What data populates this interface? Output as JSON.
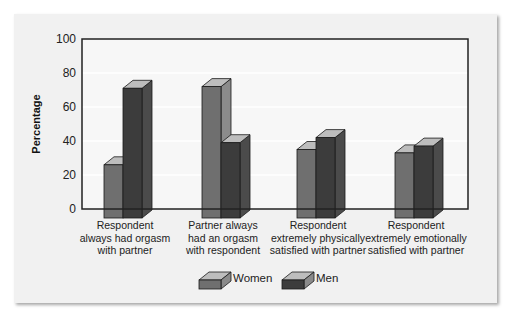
{
  "chart_data": {
    "type": "bar",
    "title": "",
    "xlabel": "",
    "ylabel": "Percentage",
    "ylim": [
      0,
      100
    ],
    "yticks": [
      0,
      20,
      40,
      60,
      80,
      100
    ],
    "grid": true,
    "legend_position": "bottom",
    "categories": [
      [
        "Respondent",
        "always had orgasm",
        "with partner"
      ],
      [
        "Partner always",
        "had an orgasm",
        "with respondent"
      ],
      [
        "Respondent",
        "extremely physically",
        "satisfied with partner"
      ],
      [
        "Respondent",
        "extremely emotionally",
        "satisfied with partner"
      ]
    ],
    "series": [
      {
        "name": "Women",
        "color": "#6f6f6f",
        "values": [
          26,
          72,
          35,
          33
        ]
      },
      {
        "name": "Men",
        "color": "#3c3c3c",
        "values": [
          71,
          39,
          42,
          37
        ]
      }
    ]
  },
  "legend": {
    "women_label": "Women",
    "men_label": "Men"
  },
  "axis": {
    "ylabel": "Percentage"
  }
}
